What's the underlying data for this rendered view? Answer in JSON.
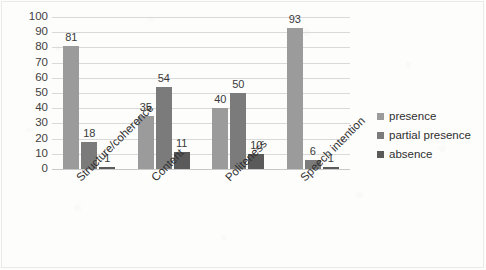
{
  "chart_data": {
    "type": "bar",
    "title": "",
    "subtitle": "",
    "xlabel": "",
    "ylabel": "",
    "ylim": [
      0,
      100
    ],
    "yticks": [
      0,
      10,
      20,
      30,
      40,
      50,
      60,
      70,
      80,
      90,
      100
    ],
    "grid": true,
    "legend_position": "right",
    "orientation": "vertical",
    "grouping": "clustered",
    "categories": [
      "Structure/coherence",
      "Content",
      "Politeness",
      "Speech intention"
    ],
    "series": [
      {
        "name": "presence",
        "color": "#9b9b9b",
        "values": [
          81,
          35,
          40,
          93
        ]
      },
      {
        "name": "partial presence",
        "color": "#7b7b7b",
        "values": [
          18,
          54,
          50,
          6
        ]
      },
      {
        "name": "absence",
        "color": "#5a5a5a",
        "values": [
          1,
          11,
          10,
          1
        ]
      }
    ],
    "data_labels": [
      [
        "81",
        "18",
        "1"
      ],
      [
        "35",
        "54",
        "11"
      ],
      [
        "40",
        "50",
        "10"
      ],
      [
        "93",
        "6",
        "1"
      ]
    ]
  },
  "axis": {
    "y_tick_labels": [
      "100",
      "90",
      "80",
      "70",
      "60",
      "50",
      "40",
      "30",
      "20",
      "10",
      "0"
    ]
  },
  "legend": {
    "items": [
      {
        "label": "presence"
      },
      {
        "label": "partial presence"
      },
      {
        "label": "absence"
      }
    ]
  }
}
